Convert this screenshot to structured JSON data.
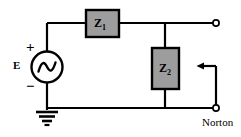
{
  "diagram": {
    "type": "electrical-circuit-schematic",
    "colors": {
      "wire": "#000000",
      "impedance_fill": "#9d9d9d",
      "impedance_stroke": "#000000",
      "background": "#ffffff",
      "text": "#000000"
    },
    "source": {
      "symbol": "ac-voltage-source",
      "label": "E",
      "polarity_top": "+",
      "polarity_bottom": "−"
    },
    "components": [
      {
        "id": "z1",
        "label": "Z",
        "subscript": "1",
        "orientation": "horizontal"
      },
      {
        "id": "z2",
        "label": "Z",
        "subscript": "2",
        "orientation": "vertical"
      }
    ],
    "ground": {
      "symbol": "earth-ground"
    },
    "terminals": {
      "top": "open-terminal",
      "bottom": "open-terminal"
    },
    "annotation": {
      "label": "Norton",
      "pointer": "left-arrow"
    }
  }
}
